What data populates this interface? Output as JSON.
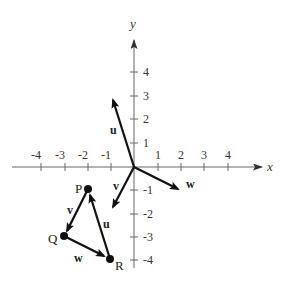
{
  "diagram": {
    "type": "coordinate-plane-vectors",
    "axes": {
      "x_label": "x",
      "y_label": "y",
      "x_ticks": [
        "-4",
        "-3",
        "-2",
        "-1",
        "1",
        "2",
        "3",
        "4"
      ],
      "y_ticks": [
        "4",
        "3",
        "2",
        "1",
        "-1",
        "-2",
        "-3",
        "-4"
      ],
      "range": {
        "x": [
          -4,
          4
        ],
        "y": [
          -4,
          4
        ]
      }
    },
    "origin_vectors": [
      {
        "name": "u",
        "from": [
          0,
          0
        ],
        "to": [
          -1,
          3
        ]
      },
      {
        "name": "v",
        "from": [
          0,
          0
        ],
        "to": [
          -1,
          -2
        ]
      },
      {
        "name": "w",
        "from": [
          0,
          0
        ],
        "to": [
          2,
          -1
        ]
      }
    ],
    "points": [
      {
        "name": "P",
        "coords": [
          -2,
          -1
        ]
      },
      {
        "name": "Q",
        "coords": [
          -3,
          -3
        ]
      },
      {
        "name": "R",
        "coords": [
          -1,
          -4
        ]
      }
    ],
    "triangle_vectors": [
      {
        "name": "v",
        "from": "P",
        "to": "Q"
      },
      {
        "name": "w",
        "from": "Q",
        "to": "R"
      },
      {
        "name": "u",
        "from": "R",
        "to": "P"
      }
    ],
    "colors": {
      "ink": "#111111",
      "axis": "#555555"
    }
  }
}
